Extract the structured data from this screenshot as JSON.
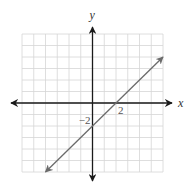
{
  "chart_data": {
    "type": "line",
    "title": "",
    "xlabel": "x",
    "ylabel": "y",
    "xlim": [
      -6,
      6
    ],
    "ylim": [
      -6,
      6
    ],
    "grid": true,
    "grid_step": 1,
    "tick_labels": [
      {
        "axis": "x",
        "value": 2,
        "text": "2"
      },
      {
        "axis": "y",
        "value": -2,
        "text": "−2"
      }
    ],
    "series": [
      {
        "name": "y = x - 2",
        "equation": "y = x - 2",
        "slope": 1,
        "intercept": -2,
        "x": [
          -4,
          6
        ],
        "y": [
          -6,
          4
        ],
        "arrows_both_ends": true
      }
    ],
    "colors": {
      "grid": "#d6d6d6",
      "axes": "#1a1a1a",
      "line": "#6b6b6b"
    }
  }
}
